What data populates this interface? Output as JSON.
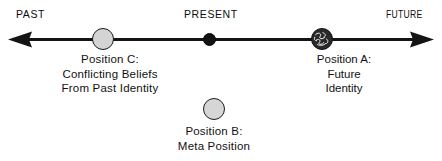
{
  "figure": {
    "type": "timeline-diagram",
    "background_color": "#ffffff",
    "line_color": "#141414"
  },
  "axis": {
    "name": "time-line",
    "left_label": "PAST",
    "center_label": "PRESENT",
    "right_label": "FUTURE",
    "left_arrow": "arrow-left",
    "right_arrow": "arrow-right"
  },
  "markers": {
    "present": {
      "name": "present-marker",
      "style": "filled-black-dot",
      "fill": "#131313"
    },
    "position_c": {
      "name": "position-c-marker",
      "style": "light-gray-circle",
      "fill": "#d4d4d4",
      "stroke": "#1a1a1a"
    },
    "position_a": {
      "name": "position-a-marker",
      "style": "dark-scribbled-circle",
      "fill": "#2a2a2a",
      "stroke": "#111111"
    },
    "position_b": {
      "name": "position-b-marker",
      "style": "light-gray-circle",
      "fill": "#d6d6d6",
      "stroke": "#1c1c1c"
    }
  },
  "captions": {
    "position_c": {
      "heading": "Position  C:",
      "line1": "Conflicting  Beliefs",
      "line2": "From  Past  Identity"
    },
    "position_a": {
      "heading": "Position A:",
      "line1": "Future",
      "line2": "Identity"
    },
    "position_b": {
      "heading": "Position  B:",
      "line1": "Meta  Position"
    }
  }
}
